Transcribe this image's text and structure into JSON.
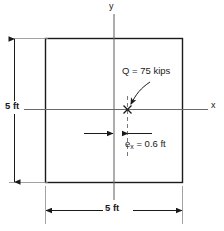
{
  "figure": {
    "type": "engineering-diagram",
    "axes": {
      "y_label": "y",
      "x_label": "x"
    },
    "dimensions": {
      "left_label": "5 ft",
      "bottom_label": "5 ft"
    },
    "annotations": {
      "load_label": "Q = 75 kips",
      "eccentricity_symbol": "e",
      "eccentricity_subscript": "x",
      "eccentricity_value": " = 0.6 ft"
    },
    "colors": {
      "line": "#1a1a1a",
      "centerline": "#555555",
      "background": "#ffffff"
    }
  }
}
